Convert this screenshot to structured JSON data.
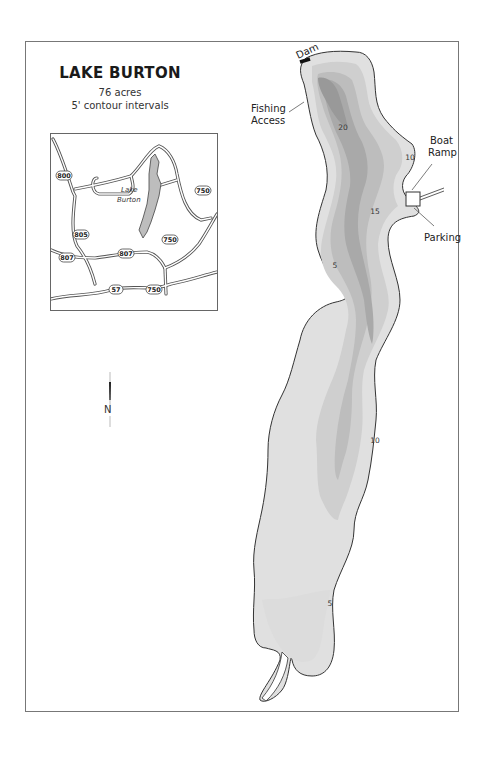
{
  "map": {
    "title": "LAKE BURTON",
    "area": "76 acres",
    "contour_note": "5' contour intervals",
    "north_label": "N",
    "colors": {
      "frame": "#777777",
      "shoreline": "#333333",
      "depth_0_5": "#e0e0e0",
      "depth_5_10": "#cfcfcf",
      "depth_10_15": "#bdbdbd",
      "depth_15_20": "#a9a9a9",
      "depth_20_plus": "#999999",
      "dam": "#111111"
    },
    "labels": {
      "dam": "Dam",
      "fishing_access_1": "Fishing",
      "fishing_access_2": "Access",
      "boat_ramp_1": "Boat",
      "boat_ramp_2": "Ramp",
      "parking": "Parking"
    },
    "depth_labels": {
      "d20": "20",
      "d10_north": "10",
      "d15": "15",
      "d5_west": "5",
      "d10_south": "10",
      "d5_south": "5"
    }
  },
  "inset": {
    "lake_label_1": "Lake",
    "lake_label_2": "Burton",
    "routes": {
      "r800": "800",
      "r805": "805",
      "r807_west": "807",
      "r807_east": "807",
      "r750_ne": "750",
      "r750_mid": "750",
      "r750_south": "750",
      "r57": "57"
    }
  }
}
